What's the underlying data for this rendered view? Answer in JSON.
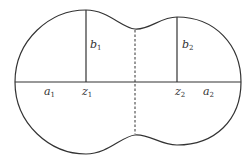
{
  "diagram": {
    "stroke_color": "#333333",
    "labels": {
      "a1": {
        "base": "a",
        "sub": "1"
      },
      "b1": {
        "base": "b",
        "sub": "1"
      },
      "z1": {
        "base": "z",
        "sub": "1"
      },
      "a2": {
        "base": "a",
        "sub": "2"
      },
      "b2": {
        "base": "b",
        "sub": "2"
      },
      "z2": {
        "base": "z",
        "sub": "2"
      }
    }
  }
}
